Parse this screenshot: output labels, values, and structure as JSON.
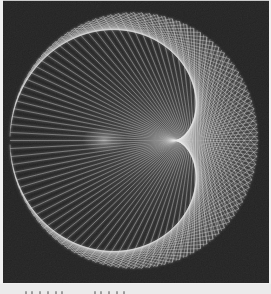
{
  "page": {
    "background_color": "#f0f0f0",
    "top_edge_color": "#c9c9c9"
  },
  "figure": {
    "kind": "string-art-cardioid",
    "background_color": "#1e1e1e",
    "points": 200,
    "multiplier": 2,
    "rotation_deg": 180,
    "circle": {
      "cx": 134,
      "cy": 139.5,
      "rx": 124,
      "ry": 128
    },
    "line_color": "#e9e9e9",
    "line_opacity": 0.5,
    "line_width": 0.7,
    "bloom_opacity": 0.22,
    "grain_opacity": 0.07,
    "cusp_glow": {
      "cx": 104,
      "cy": 139,
      "rx": 22,
      "ry": 13,
      "opacity": 0.5
    }
  },
  "caption": {
    "strip_color": "#ebebeb",
    "marks_color": "#8f8f8f",
    "marks_x": [
      25,
      31,
      39,
      47,
      55,
      61,
      94,
      100,
      108,
      116,
      123
    ]
  }
}
